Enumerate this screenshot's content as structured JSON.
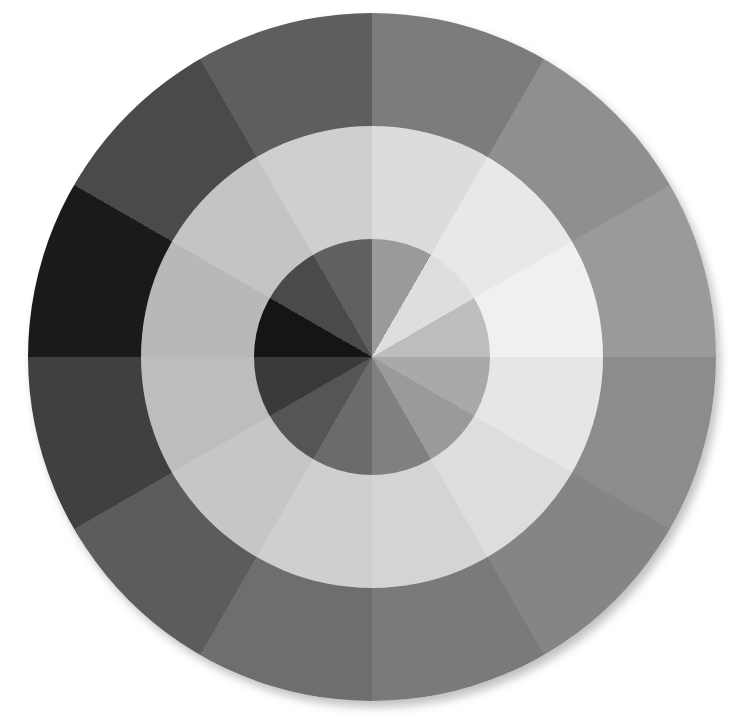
{
  "image": {
    "description": "Grayscale 12-segment color wheel with three concentric rings",
    "segments": 12,
    "outer_ring": [
      "#7c7c7c",
      "#8f8f8f",
      "#9a9a9a",
      "#8c8c8c",
      "#858585",
      "#7a7a7a",
      "#6e6e6e",
      "#5c5c5c",
      "#404040",
      "#1a1a1a",
      "#4a4a4a",
      "#5e5e5e"
    ],
    "middle_ring": [
      "#dcdcdc",
      "#e8e8e8",
      "#f0f0f0",
      "#e6e6e6",
      "#dddddd",
      "#d4d4d4",
      "#cfcfcf",
      "#c6c6c6",
      "#bdbdbd",
      "#b8b8b8",
      "#c4c4c4",
      "#cfcfcf"
    ],
    "inner_ring": [
      "#9a9a9a",
      "#dedede",
      "#bdbdbd",
      "#a9a9a9",
      "#9a9a9a",
      "#808080",
      "#6b6b6b",
      "#555555",
      "#3a3a3a",
      "#151515",
      "#4a4a4a",
      "#606060"
    ]
  }
}
